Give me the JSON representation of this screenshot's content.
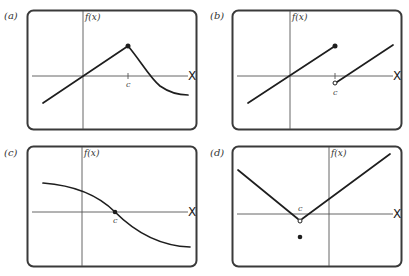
{
  "panels": [
    {
      "id": "a",
      "label": "(a)",
      "y_axis_label": "f(x)",
      "x_axis_label": "X",
      "point_label": "c",
      "description": "Line up to filled point at c, then decaying curve; continuous at c but not differentiable (corner)"
    },
    {
      "id": "b",
      "label": "(b)",
      "y_axis_label": "f(x)",
      "x_axis_label": "X",
      "point_label": "c",
      "description": "Jump discontinuity at c: filled endpoint on left segment, open circle starting right segment"
    },
    {
      "id": "c",
      "label": "(c)",
      "y_axis_label": "f(x)",
      "x_axis_label": "X",
      "point_label": "c",
      "description": "Smooth decreasing curve passing through filled point at c on x-axis"
    },
    {
      "id": "d",
      "label": "(d)",
      "y_axis_label": "f(x)",
      "x_axis_label": "X",
      "point_label": "c",
      "description": "V-shape with open circle at vertex at c; isolated filled point below (removable discontinuity)"
    }
  ],
  "colors": {
    "frame": "#3a3a3a",
    "curve": "#1e1e1e",
    "axis": "#555555",
    "background": "#ffffff"
  }
}
